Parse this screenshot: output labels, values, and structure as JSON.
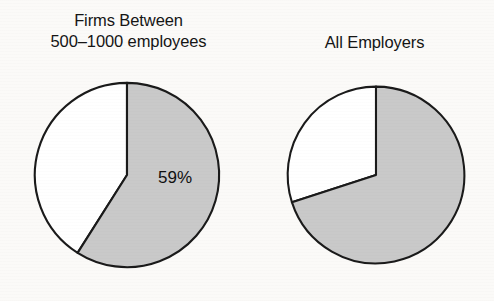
{
  "figure": {
    "background_color": "#fbfaf8",
    "ink_color": "#111111"
  },
  "chart_data": [
    {
      "type": "pie",
      "title": "Firms Between 500–1000 employees",
      "title_lines": [
        "Firms Between",
        "500–1000 employees"
      ],
      "categories": [
        "Shaded",
        "Unshaded"
      ],
      "values": [
        59,
        41
      ],
      "labels": [
        "59%",
        ""
      ],
      "colors": [
        "#c9c9c9",
        "#ffffff"
      ],
      "edge_color": "#1a1a1a",
      "start_angle_deg": 90,
      "direction": "clockwise",
      "units": "percent",
      "xlabel": "",
      "ylabel": "",
      "legend": false,
      "grid": false
    },
    {
      "type": "pie",
      "title": "All Employers",
      "title_lines": [
        "All Employers"
      ],
      "categories": [
        "Shaded",
        "Unshaded"
      ],
      "values": [
        70,
        30
      ],
      "labels": [
        "70%",
        ""
      ],
      "colors": [
        "#c9c9c9",
        "#ffffff"
      ],
      "edge_color": "#1a1a1a",
      "start_angle_deg": 90,
      "direction": "clockwise",
      "units": "percent",
      "xlabel": "",
      "ylabel": "",
      "legend": false,
      "grid": false
    }
  ],
  "panels": {
    "left": {
      "title_line_1": "Firms Between",
      "title_line_2": "500–1000 employees",
      "slice_label": "59%"
    },
    "right": {
      "title_line_1": "All Employers",
      "slice_label": "70%"
    }
  }
}
